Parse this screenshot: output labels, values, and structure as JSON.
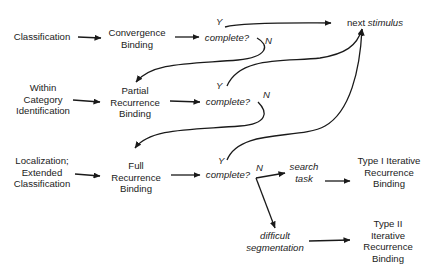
{
  "diagram": {
    "type": "flowchart",
    "inputs": {
      "classification": "Classification",
      "within_category": [
        "Within",
        "Category",
        "Identification"
      ],
      "localization": [
        "Localization;",
        "Extended",
        "Classification"
      ]
    },
    "processes": {
      "convergence": [
        "Convergence",
        "Binding"
      ],
      "partial": [
        "Partial",
        "Recurrence",
        "Binding"
      ],
      "full": [
        "Full",
        "Recurrence",
        "Binding"
      ],
      "type1": [
        "Type I Iterative",
        "Recurrence",
        "Binding"
      ],
      "type2": [
        "Type II",
        "Iterative",
        "Recurrence",
        "Binding"
      ]
    },
    "decisions": {
      "complete1": "complete?",
      "complete2": "complete?",
      "complete3": "complete?"
    },
    "branch_labels": {
      "yes": "Y",
      "no": "N"
    },
    "conditions": {
      "search_task": [
        "search",
        "task"
      ],
      "difficult_segmentation": [
        "difficult",
        "segmentation"
      ]
    },
    "terminal": {
      "prefix": "next",
      "emphasis": "stimulus"
    },
    "edges": [
      {
        "from": "Classification",
        "to": "Convergence Binding"
      },
      {
        "from": "Convergence Binding",
        "to": "complete? (1)"
      },
      {
        "from": "complete? (1)",
        "to": "next stimulus",
        "label": "Y"
      },
      {
        "from": "complete? (1)",
        "to": "Partial Recurrence Binding",
        "label": "N"
      },
      {
        "from": "Within Category Identification",
        "to": "Partial Recurrence Binding"
      },
      {
        "from": "Partial Recurrence Binding",
        "to": "complete? (2)"
      },
      {
        "from": "complete? (2)",
        "to": "next stimulus",
        "label": "Y"
      },
      {
        "from": "complete? (2)",
        "to": "Full Recurrence Binding",
        "label": "N"
      },
      {
        "from": "Localization; Extended Classification",
        "to": "Full Recurrence Binding"
      },
      {
        "from": "Full Recurrence Binding",
        "to": "complete? (3)"
      },
      {
        "from": "complete? (3)",
        "to": "next stimulus",
        "label": "Y"
      },
      {
        "from": "complete? (3)",
        "to": "search task",
        "label": "N"
      },
      {
        "from": "complete? (3)",
        "to": "difficult segmentation",
        "label": "N"
      },
      {
        "from": "search task",
        "to": "Type I Iterative Recurrence Binding"
      },
      {
        "from": "difficult segmentation",
        "to": "Type II Iterative Recurrence Binding"
      }
    ],
    "colors": {
      "ink": "#1a1a1a",
      "background": "#ffffff"
    }
  }
}
